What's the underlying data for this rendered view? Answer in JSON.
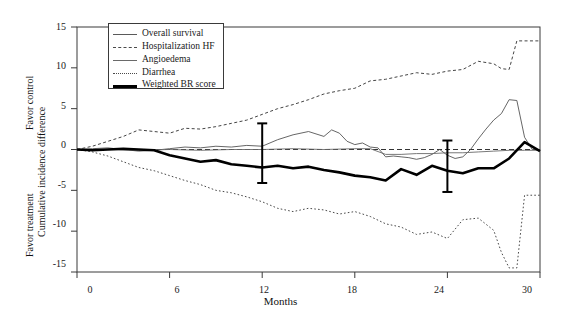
{
  "chart_data": {
    "type": "line",
    "title": "",
    "xlabel": "Months",
    "ylabel": "Cumulative incidence difference",
    "ylabel_top_annotation": "Favor control",
    "ylabel_bottom_annotation": "Favor treatment",
    "xlim": [
      0,
      30
    ],
    "ylim": [
      -15,
      15
    ],
    "xticks": [
      0,
      6,
      12,
      18,
      24,
      30
    ],
    "yticks": [
      15,
      10,
      5,
      0,
      -5,
      -10,
      -15
    ],
    "xtick_labels": [
      "0",
      "6",
      "12",
      "18",
      "24",
      "30"
    ],
    "ytick_labels": [
      "15",
      "10",
      "5",
      "0",
      "-5",
      "-10",
      "-15"
    ],
    "grid": false,
    "zero_reference_line": true,
    "legend_position": "upper-left-inside",
    "series": [
      {
        "name": "Overall survival",
        "style": "solid-thin-gray",
        "color": "#555555",
        "x": [
          0,
          1,
          2,
          3,
          4,
          5,
          6,
          7,
          8,
          9,
          10,
          11,
          12,
          13,
          14,
          15,
          16,
          16.5,
          17,
          17.5,
          18,
          18.5,
          19,
          19.5,
          20,
          20.5,
          21,
          21.5,
          22,
          22.5,
          23,
          23.5,
          24,
          24.5,
          25,
          25.5,
          26,
          26.5,
          27,
          27.5,
          28,
          28.5,
          29,
          29.5,
          30
        ],
        "values": [
          0,
          0.1,
          0.2,
          0.0,
          -0.2,
          -0.1,
          0.1,
          0.3,
          0.2,
          0.4,
          0.3,
          0.5,
          0.4,
          1.2,
          1.8,
          2.2,
          1.6,
          2.4,
          2.0,
          1.0,
          0.6,
          0.8,
          0.3,
          0.2,
          -0.9,
          -0.8,
          -0.9,
          -1.0,
          -1.2,
          -1.0,
          -0.6,
          0.0,
          -0.7,
          -1.1,
          -0.9,
          0.0,
          1.3,
          2.5,
          3.6,
          4.4,
          6.1,
          6.0,
          1.5,
          0.0,
          0.0
        ]
      },
      {
        "name": "Hospitalization HF",
        "style": "dashed-thin",
        "color": "#444444",
        "x": [
          0,
          1,
          2,
          3,
          4,
          5,
          6,
          7,
          8,
          9,
          10,
          11,
          12,
          13,
          14,
          15,
          16,
          17,
          18,
          19,
          20,
          21,
          22,
          23,
          24,
          25,
          26,
          27,
          27.5,
          28,
          28.5,
          29,
          30
        ],
        "values": [
          0,
          0.4,
          1.0,
          1.6,
          2.4,
          2.2,
          2.0,
          2.6,
          2.5,
          2.8,
          3.2,
          3.6,
          4.3,
          5.0,
          5.5,
          6.1,
          6.8,
          7.2,
          7.5,
          8.4,
          8.6,
          9.0,
          9.4,
          9.2,
          9.6,
          9.8,
          10.8,
          10.5,
          9.9,
          9.8,
          13.3,
          13.3,
          13.3
        ]
      },
      {
        "name": "Angioedema",
        "style": "solid-thin-gray",
        "color": "#6a6a6a",
        "x": [
          0,
          2,
          4,
          6,
          8,
          10,
          12,
          14,
          16,
          18,
          19,
          20,
          21,
          22,
          23,
          24,
          25,
          26,
          27,
          28,
          29,
          30
        ],
        "values": [
          0,
          0.0,
          -0.1,
          0.0,
          -0.1,
          0.0,
          0.0,
          0.1,
          0.0,
          0.1,
          0.1,
          -0.6,
          -0.6,
          -0.5,
          -0.5,
          -0.4,
          -0.4,
          -0.3,
          -0.2,
          -0.1,
          -0.1,
          -0.1
        ]
      },
      {
        "name": "Diarrhea",
        "style": "dotted-thin",
        "color": "#4a4a4a",
        "x": [
          0,
          1,
          2,
          3,
          4,
          5,
          6,
          7,
          8,
          9,
          10,
          11,
          12,
          13,
          14,
          15,
          16,
          17,
          18,
          19,
          20,
          21,
          22,
          23,
          24,
          25,
          26,
          27,
          27.5,
          28,
          28.5,
          29,
          29.5,
          30
        ],
        "values": [
          0,
          -0.3,
          -0.8,
          -1.5,
          -2.2,
          -2.6,
          -3.2,
          -3.8,
          -4.3,
          -5.0,
          -5.3,
          -5.8,
          -6.4,
          -7.2,
          -7.6,
          -7.2,
          -7.4,
          -7.9,
          -7.6,
          -8.2,
          -9.1,
          -9.5,
          -10.4,
          -10.1,
          -10.9,
          -8.6,
          -8.4,
          -9.9,
          -12.6,
          -14.5,
          -14.5,
          -5.6,
          -5.6,
          -5.6
        ]
      },
      {
        "name": "Weighted BR score",
        "style": "solid-bold-black",
        "color": "#000000",
        "x": [
          0,
          1,
          2,
          3,
          4,
          5,
          6,
          7,
          8,
          9,
          10,
          11,
          12,
          13,
          14,
          15,
          16,
          17,
          18,
          19,
          20,
          21,
          22,
          23,
          24,
          25,
          26,
          27,
          28,
          29,
          30
        ],
        "values": [
          0,
          -0.1,
          0.0,
          0.1,
          0.0,
          -0.1,
          -0.7,
          -1.1,
          -1.5,
          -1.3,
          -1.8,
          -2.0,
          -2.2,
          -2.0,
          -2.3,
          -2.1,
          -2.5,
          -2.8,
          -3.2,
          -3.4,
          -3.8,
          -2.4,
          -3.1,
          -2.0,
          -2.6,
          -2.9,
          -2.3,
          -2.3,
          -1.1,
          0.9,
          -0.2
        ]
      }
    ],
    "error_bars": [
      {
        "x": 12,
        "y": -1.0,
        "upper": 3.2,
        "lower": -4.1
      },
      {
        "x": 24,
        "y": -2.0,
        "upper": 1.1,
        "lower": -5.2
      }
    ]
  },
  "legend": {
    "entries": [
      {
        "label": "Overall survival",
        "icon": "solid-line-swatch"
      },
      {
        "label": "Hospitalization HF",
        "icon": "dashed-line-swatch"
      },
      {
        "label": "Angioedema",
        "icon": "solid-line-swatch"
      },
      {
        "label": "Diarrhea",
        "icon": "dotted-line-swatch"
      },
      {
        "label": "Weighted BR score",
        "icon": "bold-line-swatch"
      }
    ]
  }
}
